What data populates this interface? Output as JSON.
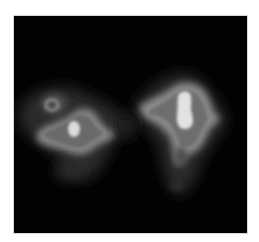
{
  "image": {
    "description": "Grayscale intensity image showing two bright blobs on a black square background",
    "background_color": "#020202",
    "page_color": "#ffffff",
    "blobs": [
      {
        "name": "left-blob",
        "core_center": [
          74,
          129
        ],
        "core_color": "#e0e0e0",
        "halo_color": "#7a7a7a",
        "ring_color": "#959595"
      },
      {
        "name": "right-blob",
        "core_center": [
          185,
          111
        ],
        "core_color": "#e4e4e4",
        "halo_color": "#7a7a7a",
        "ring_color": "#959595"
      }
    ]
  }
}
